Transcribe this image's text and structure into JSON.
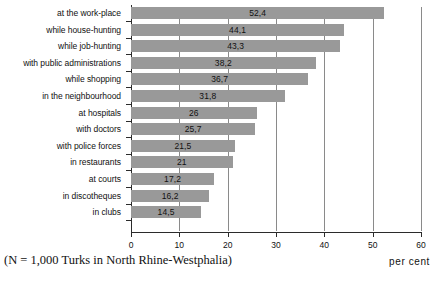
{
  "chart_data": {
    "type": "bar",
    "orientation": "horizontal",
    "title": "",
    "subtitle": "",
    "xlabel": "per cent",
    "ylabel": "",
    "xlim": [
      0,
      60
    ],
    "xticks": [
      "0",
      "10",
      "20",
      "30",
      "40",
      "50",
      "60"
    ],
    "grid": true,
    "grid_axis": "x",
    "legend": "none",
    "bar_color": "#999999",
    "axis_color": "#2b2b2b",
    "categories": [
      "at the work-place",
      "while house-hunting",
      "while job-hunting",
      "with public administrations",
      "while shopping",
      "in the neighbourhood",
      "at hospitals",
      "with doctors",
      "with police forces",
      "in restaurants",
      "at courts",
      "in discotheques",
      "in clubs"
    ],
    "values": [
      52.4,
      44.1,
      43.3,
      38.2,
      36.7,
      31.8,
      26,
      25.7,
      21.5,
      21,
      17.2,
      16.2,
      14.5
    ],
    "value_labels": [
      "52,4",
      "44,1",
      "43,3",
      "38,2",
      "36,7",
      "31,8",
      "26",
      "25,7",
      "21,5",
      "21",
      "17,2",
      "16,2",
      "14,5"
    ]
  },
  "footnote": "(N = 1,000 Turks in North Rhine-Westphalia)",
  "unit_label": "per cent"
}
